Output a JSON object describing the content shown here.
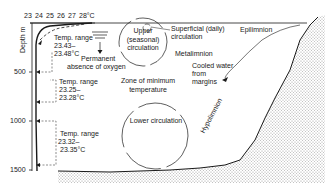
{
  "diagram": {
    "type": "lake-cross-section",
    "temperature_axis": {
      "ticks": [
        "23",
        "24",
        "25",
        "26",
        "27",
        "28°C"
      ]
    },
    "depth_axis": {
      "label": "Depth m",
      "ticks": [
        "500",
        "1000",
        "1500"
      ]
    },
    "temp_ranges": [
      {
        "title": "Temp. range",
        "low": "23.43–",
        "high": "23.48°C"
      },
      {
        "title": "Temp. range",
        "low": "23.25–",
        "high": "23.28°C"
      },
      {
        "title": "Temp. range",
        "low": "23.32–",
        "high": "23.35°C"
      }
    ],
    "labels": {
      "oxygen_line1": "Permanent",
      "oxygen_line2": "absence of oxygen",
      "upper_circ_1": "Upper",
      "upper_circ_2": "(seasonal)",
      "upper_circ_3": "circulation",
      "superficial_1": "Superficial (daily)",
      "superficial_2": "circulation",
      "epilimnion": "Epilimnion",
      "metalimnion": "Metalimnion",
      "cooled_1": "Cooled water",
      "cooled_2": "from",
      "cooled_3": "margins",
      "min_temp_1": "Zone of minimum",
      "min_temp_2": "temperature",
      "lower_circ": "Lower circulation",
      "hypolimnion": "Hypolimnion"
    },
    "colors": {
      "line": "#1a1a1a",
      "sediment": "#bdbdbd",
      "background": "#ffffff"
    }
  }
}
